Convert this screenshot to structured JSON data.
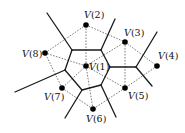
{
  "diagram": {
    "type": "voronoi-delaunay",
    "points": [
      {
        "id": "V1",
        "label_v": "V",
        "label_n": "(1)",
        "x": 86,
        "y": 66,
        "lx": 89,
        "ly": 70
      },
      {
        "id": "V2",
        "label_v": "V",
        "label_n": "(2)",
        "x": 86,
        "y": 25,
        "lx": 84,
        "ly": 18
      },
      {
        "id": "V3",
        "label_v": "V",
        "label_n": "(3)",
        "x": 125,
        "y": 42,
        "lx": 124,
        "ly": 36
      },
      {
        "id": "V4",
        "label_v": "V",
        "label_n": "(4)",
        "x": 157,
        "y": 66,
        "lx": 158,
        "ly": 59
      },
      {
        "id": "V5",
        "label_v": "V",
        "label_n": "(5)",
        "x": 125,
        "y": 88,
        "lx": 128,
        "ly": 99
      },
      {
        "id": "V6",
        "label_v": "V",
        "label_n": "(6)",
        "x": 93,
        "y": 109,
        "lx": 86,
        "ly": 122
      },
      {
        "id": "V7",
        "label_v": "V",
        "label_n": "(7)",
        "x": 62,
        "y": 88,
        "lx": 44,
        "ly": 100
      },
      {
        "id": "V8",
        "label_v": "V",
        "label_n": "(8)",
        "x": 45,
        "y": 53,
        "lx": 22,
        "ly": 57
      }
    ],
    "voronoi_edges": [
      [
        72,
        50,
        101,
        50
      ],
      [
        101,
        50,
        110,
        67
      ],
      [
        110,
        67,
        101,
        85
      ],
      [
        101,
        85,
        82,
        90
      ],
      [
        82,
        90,
        65,
        70
      ],
      [
        65,
        70,
        72,
        50
      ],
      [
        110,
        67,
        136,
        67
      ],
      [
        72,
        50,
        47,
        13
      ],
      [
        101,
        50,
        115,
        19
      ],
      [
        136,
        67,
        157,
        32
      ],
      [
        136,
        67,
        152,
        86
      ],
      [
        101,
        85,
        116,
        117
      ],
      [
        82,
        90,
        65,
        118
      ],
      [
        65,
        70,
        15,
        92
      ]
    ],
    "delaunay_edges": [
      [
        "V1",
        "V2"
      ],
      [
        "V1",
        "V3"
      ],
      [
        "V1",
        "V5"
      ],
      [
        "V1",
        "V6"
      ],
      [
        "V1",
        "V7"
      ],
      [
        "V1",
        "V8"
      ],
      [
        "V2",
        "V3"
      ],
      [
        "V2",
        "V8"
      ],
      [
        "V3",
        "V4"
      ],
      [
        "V3",
        "V5"
      ],
      [
        "V4",
        "V5"
      ],
      [
        "V5",
        "V6"
      ],
      [
        "V6",
        "V7"
      ],
      [
        "V7",
        "V8"
      ]
    ]
  }
}
